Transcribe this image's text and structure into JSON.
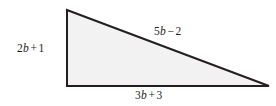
{
  "figure": {
    "name": "right-triangle-with-algebraic-side-labels",
    "background_color": "#ffffff",
    "fill_color": "#f2f2f2",
    "stroke_color": "#231f20",
    "stroke_width": 2,
    "vertices": {
      "top_left": [
        67,
        10
      ],
      "bottom_left": [
        67,
        86
      ],
      "bottom_right": [
        269,
        86
      ]
    }
  },
  "labels": {
    "left_side": {
      "full_text": "2b + 1",
      "coefficient": "2",
      "variable": "b",
      "operator": "+",
      "constant": "1"
    },
    "hypotenuse": {
      "full_text": "5b − 2",
      "coefficient": "5",
      "variable": "b",
      "operator": "−",
      "constant": "2"
    },
    "bottom_side": {
      "full_text": "3b + 3",
      "coefficient": "3",
      "variable": "b",
      "operator": "+",
      "constant": "3"
    }
  }
}
